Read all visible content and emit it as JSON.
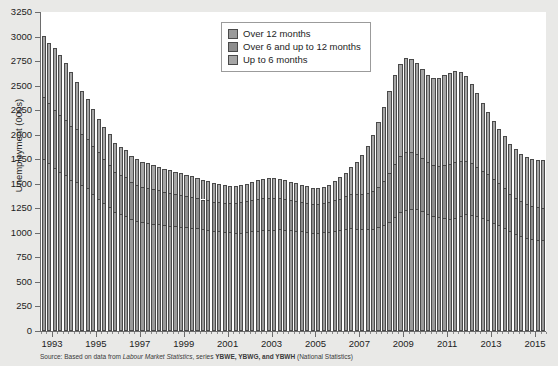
{
  "chart_data": {
    "type": "bar",
    "stacked": true,
    "title": "",
    "xlabel": "",
    "ylabel": "Unemployment (000s)",
    "ylim": [
      0,
      3250
    ],
    "ytick_step": 250,
    "yticks": [
      0,
      250,
      500,
      750,
      1000,
      1250,
      1500,
      1750,
      2000,
      2250,
      2500,
      2750,
      3000,
      3250
    ],
    "xticks": [
      "1993",
      "1995",
      "1997",
      "1999",
      "2001",
      "2003",
      "2005",
      "2007",
      "2009",
      "2011",
      "2013",
      "2015"
    ],
    "x_range": [
      1993,
      2015.75
    ],
    "frequency": "quarterly",
    "grid": false,
    "legend_position": "top-center",
    "series": [
      {
        "name": "Up to 6 months",
        "color": "#a6a6a6",
        "values": [
          1755,
          1715,
          1660,
          1620,
          1585,
          1540,
          1520,
          1490,
          1455,
          1400,
          1350,
          1300,
          1265,
          1210,
          1190,
          1175,
          1140,
          1120,
          1110,
          1105,
          1095,
          1090,
          1080,
          1075,
          1070,
          1060,
          1055,
          1050,
          1045,
          1035,
          1030,
          1020,
          1015,
          1010,
          1005,
          1000,
          1000,
          1005,
          1015,
          1020,
          1025,
          1030,
          1030,
          1035,
          1030,
          1025,
          1020,
          1015,
          1010,
          1000,
          1000,
          1005,
          1010,
          1020,
          1030,
          1040,
          1045,
          1040,
          1035,
          1035,
          1040,
          1055,
          1080,
          1115,
          1165,
          1210,
          1235,
          1245,
          1240,
          1225,
          1195,
          1175,
          1160,
          1150,
          1145,
          1155,
          1175,
          1190,
          1185,
          1170,
          1150,
          1130,
          1105,
          1080,
          1050,
          1015,
          985,
          965,
          950,
          940,
          930,
          925
        ]
      },
      {
        "name": "Over 6 and up to 12 months",
        "color": "#8d8d8d",
        "values": [
          625,
          610,
          595,
          580,
          565,
          550,
          535,
          520,
          505,
          490,
          470,
          450,
          430,
          415,
          400,
          390,
          380,
          370,
          360,
          355,
          350,
          345,
          340,
          335,
          330,
          325,
          320,
          315,
          310,
          305,
          300,
          295,
          295,
          295,
          300,
          305,
          310,
          315,
          320,
          325,
          330,
          330,
          325,
          320,
          315,
          310,
          305,
          300,
          295,
          290,
          290,
          295,
          300,
          310,
          320,
          335,
          350,
          360,
          365,
          370,
          385,
          410,
          445,
          490,
          540,
          575,
          590,
          580,
          560,
          540,
          525,
          520,
          525,
          540,
          555,
          565,
          560,
          545,
          525,
          505,
          485,
          465,
          445,
          425,
          405,
          385,
          370,
          355,
          345,
          335,
          330,
          325
        ]
      },
      {
        "name": "Over 12 months",
        "color": "#9a9a9a",
        "values": [
          625,
          605,
          630,
          610,
          585,
          545,
          480,
          440,
          405,
          370,
          345,
          325,
          310,
          295,
          285,
          275,
          265,
          260,
          255,
          250,
          245,
          240,
          235,
          230,
          225,
          220,
          215,
          210,
          205,
          200,
          195,
          190,
          185,
          180,
          175,
          175,
          175,
          180,
          185,
          190,
          195,
          200,
          200,
          195,
          190,
          185,
          180,
          175,
          170,
          165,
          165,
          170,
          180,
          195,
          215,
          240,
          275,
          325,
          395,
          480,
          570,
          665,
          755,
          840,
          900,
          940,
          955,
          950,
          930,
          905,
          890,
          885,
          895,
          915,
          930,
          925,
          900,
          860,
          810,
          750,
          690,
          635,
          590,
          555,
          530,
          510,
          495,
          485,
          480,
          480,
          485,
          495
        ]
      }
    ]
  },
  "legend": {
    "items": [
      {
        "label": "Over 12 months",
        "swatch": "s2"
      },
      {
        "label": "Over 6 and up to 12 months",
        "swatch": "s1"
      },
      {
        "label": "Up to 6 months",
        "swatch": "s0"
      }
    ]
  },
  "source_note": {
    "prefix": "Source:",
    "text_before": " Based on data from ",
    "italic_title": "Labour Market Statistics",
    "text_middle": ", series ",
    "series_codes": "YBWE, YBWG, and YBWH",
    "text_after": " (National Statistics)"
  }
}
